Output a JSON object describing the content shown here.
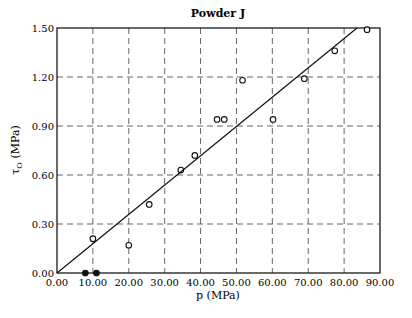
{
  "chart_data": {
    "type": "scatter",
    "title": "Powder J",
    "xlabel": "p (MPa)",
    "ylabel": "τO (MPa)",
    "ylabel_main": "τ",
    "ylabel_sub": "O",
    "ylabel_unit": " (MPa)",
    "xlim": [
      0,
      90
    ],
    "ylim": [
      0,
      1.5
    ],
    "grid": true,
    "grid_style": "dashed",
    "x_ticks": [
      0,
      10,
      20,
      30,
      40,
      50,
      60,
      70,
      80,
      90
    ],
    "x_tick_labels": [
      "0.00",
      "10.00",
      "20.00",
      "30.00",
      "40.00",
      "50.00",
      "60.00",
      "70.00",
      "80.00",
      "90.00"
    ],
    "y_ticks": [
      0,
      0.3,
      0.6,
      0.9,
      1.2,
      1.5
    ],
    "y_tick_labels": [
      "0.00",
      "0.30",
      "0.60",
      "0.90",
      "1.20",
      "1.50"
    ],
    "series": [
      {
        "name": "measured (open)",
        "marker": "open-circle",
        "points": [
          {
            "x": 10.0,
            "y": 0.21
          },
          {
            "x": 20.0,
            "y": 0.17
          },
          {
            "x": 25.7,
            "y": 0.42
          },
          {
            "x": 34.5,
            "y": 0.63
          },
          {
            "x": 38.4,
            "y": 0.72
          },
          {
            "x": 44.6,
            "y": 0.94
          },
          {
            "x": 46.6,
            "y": 0.94
          },
          {
            "x": 51.7,
            "y": 1.18
          },
          {
            "x": 60.2,
            "y": 0.94
          },
          {
            "x": 68.9,
            "y": 1.19
          },
          {
            "x": 77.4,
            "y": 1.36
          },
          {
            "x": 86.4,
            "y": 1.49
          }
        ]
      },
      {
        "name": "measured (filled)",
        "marker": "filled-circle",
        "points": [
          {
            "x": 7.9,
            "y": 0.0
          },
          {
            "x": 11.0,
            "y": 0.0
          }
        ]
      },
      {
        "name": "linear fit",
        "type": "line",
        "points": [
          {
            "x": 0,
            "y": 0
          },
          {
            "x": 83.6,
            "y": 1.5
          }
        ]
      }
    ],
    "legend": null
  }
}
